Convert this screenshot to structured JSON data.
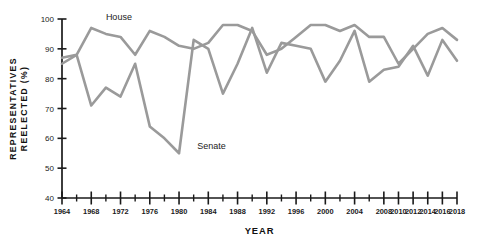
{
  "chart_data": {
    "type": "line",
    "title": "",
    "xlabel": "YEAR",
    "ylabel_line1": "REPRESENTATIVES",
    "ylabel_line2": "REELECTED (%)",
    "ylabel": "REPRESENTATIVES REELECTED (%)",
    "grid": false,
    "legend_position": "inline-annotations",
    "xlim": [
      1964,
      2018
    ],
    "ylim": [
      40,
      100
    ],
    "ytick_values": [
      40,
      50,
      60,
      70,
      80,
      90,
      100
    ],
    "ytick_labels": [
      "40",
      "50",
      "60",
      "70",
      "80",
      "90",
      "100"
    ],
    "x": [
      1964,
      1966,
      1968,
      1970,
      1972,
      1974,
      1976,
      1978,
      1980,
      1982,
      1984,
      1986,
      1988,
      1990,
      1992,
      1994,
      1996,
      1998,
      2000,
      2002,
      2004,
      2006,
      2008,
      2010,
      2012,
      2014,
      2016,
      2018
    ],
    "xtick_values": [
      1964,
      1966,
      1968,
      1970,
      1972,
      1974,
      1976,
      1978,
      1980,
      1982,
      1984,
      1986,
      1988,
      1990,
      1992,
      1994,
      1996,
      1998,
      2000,
      2002,
      2004,
      2006,
      2008,
      2010,
      2012,
      2014,
      2016,
      2018
    ],
    "xtick_labels": [
      {
        "value": 1964,
        "label": "1964",
        "major": true
      },
      {
        "value": 1966,
        "label": "",
        "major": false
      },
      {
        "value": 1968,
        "label": "1968",
        "major": true
      },
      {
        "value": 1970,
        "label": "",
        "major": false
      },
      {
        "value": 1972,
        "label": "1972",
        "major": true
      },
      {
        "value": 1974,
        "label": "",
        "major": false
      },
      {
        "value": 1976,
        "label": "1976",
        "major": true
      },
      {
        "value": 1978,
        "label": "",
        "major": false
      },
      {
        "value": 1980,
        "label": "1980",
        "major": true
      },
      {
        "value": 1982,
        "label": "",
        "major": false
      },
      {
        "value": 1984,
        "label": "1984",
        "major": true
      },
      {
        "value": 1986,
        "label": "",
        "major": false
      },
      {
        "value": 1988,
        "label": "1988",
        "major": true
      },
      {
        "value": 1990,
        "label": "",
        "major": false
      },
      {
        "value": 1992,
        "label": "1992",
        "major": true
      },
      {
        "value": 1994,
        "label": "",
        "major": false
      },
      {
        "value": 1996,
        "label": "1996",
        "major": true
      },
      {
        "value": 1998,
        "label": "",
        "major": false
      },
      {
        "value": 2000,
        "label": "2000",
        "major": true
      },
      {
        "value": 2002,
        "label": "",
        "major": false
      },
      {
        "value": 2004,
        "label": "2004",
        "major": true
      },
      {
        "value": 2006,
        "label": "",
        "major": false
      },
      {
        "value": 2008,
        "label": "2008",
        "major": true
      },
      {
        "value": 2010,
        "label": "2010",
        "major": true
      },
      {
        "value": 2012,
        "label": "2012",
        "major": true
      },
      {
        "value": 2014,
        "label": "2014",
        "major": true
      },
      {
        "value": 2016,
        "label": "2016",
        "major": true
      },
      {
        "value": 2018,
        "label": "2018",
        "major": true
      }
    ],
    "series": [
      {
        "name": "House",
        "color": "#9a9a9a",
        "label_annotation": "House",
        "values": [
          87,
          88,
          97,
          95,
          94,
          88,
          96,
          94,
          91,
          90,
          92,
          98,
          98,
          96,
          88,
          90,
          94,
          98,
          98,
          96,
          98,
          94,
          94,
          85,
          90,
          95,
          97,
          93
        ]
      },
      {
        "name": "Senate",
        "color": "#9a9a9a",
        "label_annotation": "Senate",
        "values": [
          85,
          88,
          71,
          77,
          74,
          85,
          64,
          60,
          55,
          93,
          90,
          75,
          85,
          97,
          82,
          92,
          91,
          90,
          79,
          86,
          96,
          79,
          83,
          84,
          91,
          81,
          93,
          86
        ]
      }
    ],
    "annotations": [
      {
        "text": "House",
        "x": 1970,
        "y": 99.5
      },
      {
        "text": "Senate",
        "x": 1982.5,
        "y": 56.5
      }
    ],
    "colors": {
      "line": "#9a9a9a",
      "axis": "#1a1a1a",
      "text": "#111111",
      "background": "#ffffff"
    }
  }
}
